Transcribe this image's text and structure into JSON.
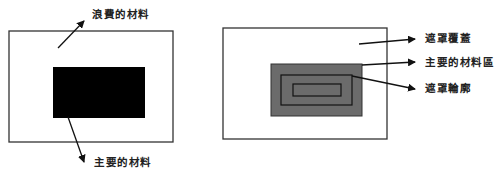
{
  "left_diagram": {
    "labels": {
      "waste": "浪費的材料",
      "main": "主要的材料"
    },
    "colors": {
      "outline": "#333333",
      "material": "#000000"
    }
  },
  "right_diagram": {
    "labels": {
      "mask_cover": "遮罩覆蓋",
      "main_area": "主要的材料區",
      "mask_outline": "遮罩輪廓"
    },
    "colors": {
      "outline": "#333333",
      "mask_fill": "#6b6b6b"
    }
  }
}
